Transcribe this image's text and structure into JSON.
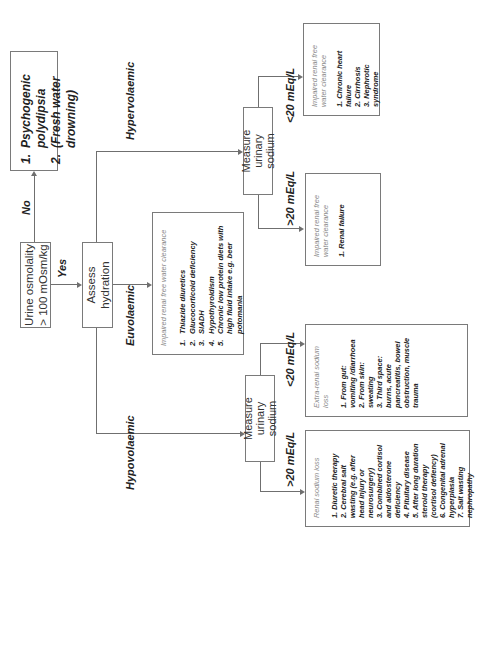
{
  "start": {
    "question": "Urine osmolality > 100 mOsm/kg",
    "yes_label": "Yes",
    "no_label": "No"
  },
  "no_outcome": {
    "items": [
      {
        "num": "1.",
        "text": "Psychogenic polydipsia"
      },
      {
        "num": "2.",
        "text": "(Fresh water drowning)"
      }
    ]
  },
  "assess": {
    "label": "Assess hydration"
  },
  "branches": {
    "hypovolaemic": {
      "label": "Hypovolaemic",
      "measure_label": "Measure urinary sodium",
      "high": {
        "threshold": ">20 mEq/L",
        "title": "Renal sodium loss",
        "items": [
          "1. Diuretic therapy",
          "2. Cerebral salt wasting (e.g. after head injury or neurosurgery)",
          "3. Combined cortisol and aldosterone deficiency",
          "4. Pituitary disease",
          "5. After long duration steroid therapy (cortisol defiency)",
          "6. Congenital adrenal hyperplasia",
          "7. Salt wasting nephropathy"
        ]
      },
      "low": {
        "threshold": "<20 mEq/L",
        "title": "Extra-renal sodium loss",
        "items": [
          "1. From gut: vomiting /diarrhoea",
          "2. From skin: sweating",
          "3. Third space: burns, acute pancreatitis, bowel obstruction, muscle trauma"
        ]
      }
    },
    "euvolaemic": {
      "label": "Euvolaemic",
      "title": "Impaired renal free water clearance",
      "items": [
        {
          "num": "1.",
          "text": "Thiazide diuretics"
        },
        {
          "num": "2.",
          "text": "Glucocorticoid deficiency"
        },
        {
          "num": "3.",
          "text": "SIADH"
        },
        {
          "num": "4.",
          "text": "Hypothyroidism"
        },
        {
          "num": "5.",
          "text": "Chronic low protein diets with high fluid intake e.g. beer potomania"
        }
      ]
    },
    "hypervolaemic": {
      "label": "Hypervolaemic",
      "measure_label": "Measure urinary sodium",
      "high": {
        "threshold": ">20 mEq/L",
        "title": "Impaired renal free water clearance",
        "items": [
          "1. Renal failure"
        ]
      },
      "low": {
        "threshold": "<20 mEq/L",
        "title": "Impaired renal free water clearance",
        "items": [
          "1. Chronic heart failure",
          "2. Cirrhosis",
          "3. Nephrotic syndrome"
        ]
      }
    }
  },
  "colors": {
    "line": "#6f6f6f",
    "border": "#7a7a7a",
    "title_grey": "#8a8a8a",
    "text": "#222222"
  }
}
